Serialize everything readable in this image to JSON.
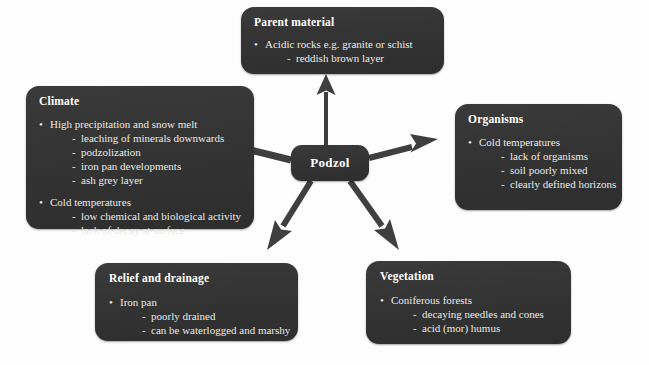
{
  "diagram": {
    "background_color": "#fdfdfd",
    "node_fill_color": "#343434",
    "node_text_color": "#eceae6",
    "arrow_color": "#3a3a3a",
    "center": {
      "label": "Podzol"
    },
    "nodes": [
      {
        "id": "parent-material",
        "title": "Parent material",
        "lines": [
          {
            "level": 1,
            "text": "Acidic rocks e.g. granite or schist"
          },
          {
            "level": 2,
            "text": "reddish brown layer"
          }
        ]
      },
      {
        "id": "climate",
        "title": "Climate",
        "lines": [
          {
            "level": 1,
            "text": "High precipitation and snow melt"
          },
          {
            "level": 2,
            "text": "leaching of minerals downwards"
          },
          {
            "level": 2,
            "text": "podzolization"
          },
          {
            "level": 2,
            "text": "iron pan developments"
          },
          {
            "level": 2,
            "text": "ash grey layer"
          },
          {
            "level": 0,
            "text": ""
          },
          {
            "level": 1,
            "text": "Cold temperatures"
          },
          {
            "level": 2,
            "text": "low chemical and biological activity"
          },
          {
            "level": 2,
            "text": "lack of decay at surface"
          }
        ]
      },
      {
        "id": "organisms",
        "title": "Organisms",
        "lines": [
          {
            "level": 1,
            "text": "Cold temperatures"
          },
          {
            "level": 2,
            "text": "lack of organisms"
          },
          {
            "level": 2,
            "text": "soil poorly mixed"
          },
          {
            "level": 2,
            "text": "clearly defined horizons"
          }
        ]
      },
      {
        "id": "relief-and-drainage",
        "title": "Relief and drainage",
        "lines": [
          {
            "level": 1,
            "text": "Iron pan"
          },
          {
            "level": 2,
            "text": "poorly drained"
          },
          {
            "level": 2,
            "text": "can be waterlogged and marshy"
          }
        ]
      },
      {
        "id": "vegetation",
        "title": "Vegetation",
        "lines": [
          {
            "level": 1,
            "text": "Coniferous forests"
          },
          {
            "level": 2,
            "text": "decaying needles and cones"
          },
          {
            "level": 2,
            "text": "acid (mor) humus"
          }
        ]
      }
    ],
    "arrows": [
      {
        "id": "arrow-to-parent-material",
        "direction": "up",
        "target": "parent-material"
      },
      {
        "id": "arrow-to-climate",
        "direction": "up-left",
        "target": "climate"
      },
      {
        "id": "arrow-to-organisms",
        "direction": "up-right",
        "target": "organisms"
      },
      {
        "id": "arrow-to-relief",
        "direction": "down-left",
        "target": "relief-and-drainage"
      },
      {
        "id": "arrow-to-vegetation",
        "direction": "down-right",
        "target": "vegetation"
      }
    ]
  }
}
